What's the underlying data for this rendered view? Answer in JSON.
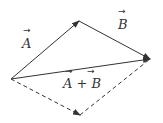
{
  "diagram": {
    "vectors": [
      {
        "name": "A",
        "label": "A",
        "from": [
          11,
          79
        ],
        "to": [
          79,
          21
        ],
        "style": "solid"
      },
      {
        "name": "B",
        "label": "B",
        "from": [
          79,
          21
        ],
        "to": [
          150,
          59
        ],
        "style": "solid"
      },
      {
        "name": "A+B",
        "label": "A + B",
        "from": [
          11,
          79
        ],
        "to": [
          150,
          59
        ],
        "style": "solid"
      },
      {
        "name": "B-translated",
        "label": "",
        "from": [
          11,
          79
        ],
        "to": [
          80,
          115
        ],
        "style": "dashed"
      },
      {
        "name": "A-translated",
        "label": "",
        "from": [
          80,
          115
        ],
        "to": [
          150,
          59
        ],
        "style": "dashed"
      }
    ],
    "labels": {
      "a": "A",
      "b": "B",
      "sum": "A + B",
      "arrow": "→"
    },
    "color": "#333333"
  }
}
